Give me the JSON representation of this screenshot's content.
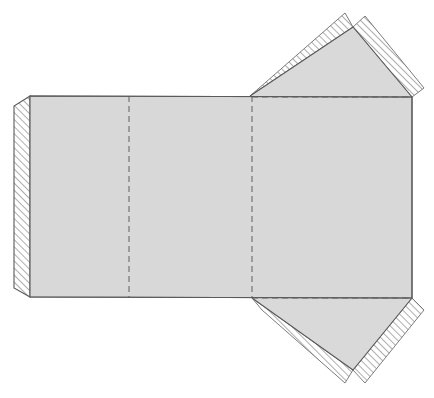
{
  "document": {
    "title": "Packaging Dieline Template",
    "type": "flat-box-die-cut-layout",
    "canvas": {
      "width": 434,
      "height": 398,
      "background": "#ffffff"
    }
  },
  "colors": {
    "panel_fill": "#d8d8d8",
    "flap_fill": "#d9d9d9",
    "cut_line": "#5a5a5a",
    "fold_line": "#6b6b6b",
    "hatch_line": "#8f8f8f",
    "hatch_background": "#ffffff",
    "page_background": "#ffffff"
  },
  "line_styles": {
    "cut_label": "solid",
    "fold_label": "dashed",
    "glue_label": "diagonal-hatch"
  },
  "geometry": {
    "body": {
      "name": "main-body-panel",
      "top_edge_y": 96,
      "bottom_edge_y": 297,
      "left_edge_x": 30,
      "right_edge_x": 412,
      "points": "30,96 412,97 412,298 30,297"
    },
    "left_glue_flap": {
      "name": "left-glue-flap",
      "points": "30,96 14,106 14,288 30,297",
      "hatched": true
    },
    "fold_lines": [
      {
        "name": "vertical-fold-1",
        "x1": 129,
        "y1": 96,
        "x2": 129,
        "y2": 297
      },
      {
        "name": "vertical-fold-2",
        "x1": 252,
        "y1": 96,
        "x2": 252,
        "y2": 298
      },
      {
        "name": "horizontal-fold-top",
        "x1": 252,
        "y1": 97,
        "x2": 412,
        "y2": 97
      },
      {
        "name": "horizontal-fold-bottom",
        "x1": 252,
        "y1": 298,
        "x2": 412,
        "y2": 298
      }
    ],
    "top_flap": {
      "name": "top-closure-flap",
      "gray_points": "250,96 353,27 412,97",
      "hatch_left_points": "250,96 345,13 353,27",
      "hatch_right_points": "353,27 365,16 424,88 412,97",
      "apex_x": 353,
      "apex_y": 27
    },
    "bottom_flap": {
      "name": "bottom-closure-flap",
      "gray_points": "252,298 353,370 412,298",
      "hatch_left_points": "252,298 262,310 345,383 353,370",
      "hatch_right_points": "353,370 365,383 424,310 412,298",
      "apex_x": 353,
      "apex_y": 370
    }
  },
  "regions": [
    {
      "id": "panel-a",
      "name": "left-side-panel",
      "label": "Panel A"
    },
    {
      "id": "panel-b",
      "name": "front-panel",
      "label": "Panel B"
    },
    {
      "id": "panel-c",
      "name": "right-side-panel",
      "label": "Panel C"
    },
    {
      "id": "flap-top",
      "name": "top-flap",
      "label": "Top Flap"
    },
    {
      "id": "flap-bottom",
      "name": "bottom-flap",
      "label": "Bottom Flap"
    },
    {
      "id": "flap-left",
      "name": "left-glue-tab",
      "label": "Glue Tab"
    }
  ]
}
